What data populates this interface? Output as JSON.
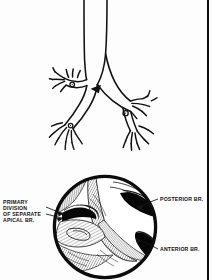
{
  "figure": {
    "ink_color": "#111111",
    "background_color": "#fdfdfd",
    "rule_color": "#0d0d0d"
  },
  "labels": {
    "primary_division": "PRIMARY\nDIVISION\nOF SEPARATE\nAPICAL BR.",
    "posterior_branch": "POSTERIOR BR.",
    "anterior_branch": "ANTERIOR BR."
  },
  "icons": {
    "arrow_marker": "solid-arrowhead-icon",
    "ring_marker_left": "ring-marker-icon",
    "ring_marker_right": "ring-marker-icon",
    "inset_circle": "circular-inset-icon"
  },
  "diagram_parts": {
    "trachea": "trachea",
    "carina": "carina",
    "right_main_bronchus": "right-main-bronchus",
    "left_main_bronchus": "left-main-bronchus",
    "upper_lobe_branches": "upper-lobe-branches",
    "lower_lobe_branches": "lower-lobe-branches",
    "bronchoscopic_view": "bronchoscopic-view"
  }
}
